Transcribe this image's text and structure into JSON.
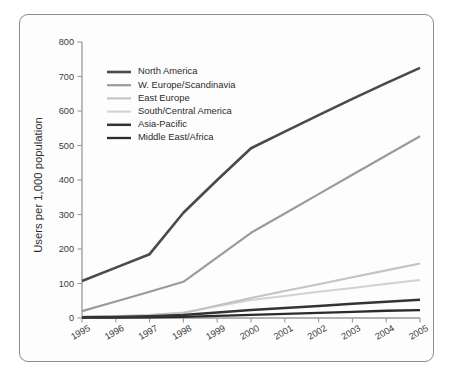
{
  "chart_data": {
    "type": "line",
    "title": "",
    "subtitle": "",
    "xlabel": "",
    "ylabel": "Users per 1,000 population",
    "categories": [
      "1995",
      "1996",
      "1997",
      "1998",
      "1999",
      "2000",
      "2001",
      "2002",
      "2003",
      "2004",
      "2005"
    ],
    "x": [
      1995,
      1996,
      1997,
      1998,
      1999,
      2000,
      2001,
      2002,
      2003,
      2004,
      2005
    ],
    "xlim": [
      1995,
      2005
    ],
    "ylim": [
      0,
      800
    ],
    "ytick_values": [
      0,
      100,
      200,
      300,
      400,
      500,
      600,
      700,
      800
    ],
    "ytick_labels": [
      "0",
      "100",
      "200",
      "300",
      "400",
      "500",
      "600",
      "700",
      "800"
    ],
    "grid": false,
    "legend_position": "upper-left",
    "series": [
      {
        "name": "North America",
        "color": "#4a4a4a",
        "width": 2.6,
        "values": [
          107,
          146,
          185,
          305,
          400,
          492,
          540,
          588,
          635,
          681,
          725
        ]
      },
      {
        "name": "W. Europe/Scandinavia",
        "color": "#9b9b9b",
        "width": 2.2,
        "values": [
          20,
          48,
          76,
          105,
          176,
          247,
          303,
          359,
          415,
          471,
          527
        ]
      },
      {
        "name": "East Europe",
        "color": "#c3c3c3",
        "width": 2.1,
        "values": [
          3,
          5,
          8,
          14,
          36,
          58,
          78,
          98,
          118,
          138,
          158
        ]
      },
      {
        "name": "South/Central America",
        "color": "#d2d2d2",
        "width": 2.1,
        "values": [
          4,
          6,
          9,
          16,
          34,
          52,
          64,
          76,
          87,
          99,
          110
        ]
      },
      {
        "name": "Asia-Pacific",
        "color": "#333333",
        "width": 2.5,
        "values": [
          2,
          3,
          5,
          9,
          16,
          23,
          29,
          35,
          41,
          47,
          53
        ]
      },
      {
        "name": "Middle East/Africa",
        "color": "#2b2b2b",
        "width": 2.3,
        "values": [
          1,
          1,
          2,
          3,
          6,
          9,
          12,
          15,
          18,
          21,
          23
        ]
      }
    ]
  },
  "axes": {
    "y_title": "Users per 1,000 population",
    "y_ticks": [
      "800",
      "700",
      "600",
      "500",
      "400",
      "300",
      "200",
      "100",
      "0"
    ],
    "x_ticks": [
      "1995",
      "1996",
      "1997",
      "1998",
      "1999",
      "2000",
      "2001",
      "2002",
      "2003",
      "2004",
      "2005"
    ]
  },
  "legend": {
    "items": [
      {
        "label": "North America"
      },
      {
        "label": "W. Europe/Scandinavia"
      },
      {
        "label": "East Europe"
      },
      {
        "label": "South/Central America"
      },
      {
        "label": "Asia-Pacific"
      },
      {
        "label": "Middle East/Africa"
      }
    ]
  },
  "colors": {
    "frame_border": "#8d8d8d",
    "axis": "#9a9a9a",
    "background": "#fdfdfd",
    "text": "#2d2d2d"
  }
}
